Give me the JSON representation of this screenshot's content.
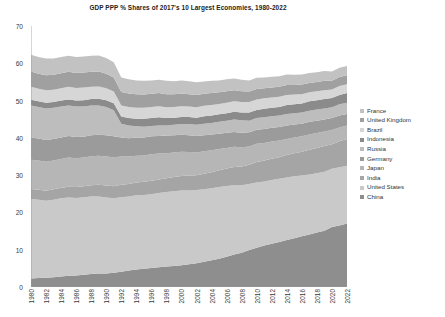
{
  "chart_data": {
    "type": "area",
    "stacked": true,
    "title": "GDP PPP % Shares of 2017's 10 Largest Economies, 1980-2022",
    "xlabel": "",
    "ylabel": "",
    "ylim": [
      0,
      70
    ],
    "ytick_step": 10,
    "yticks": [
      0,
      10,
      20,
      30,
      40,
      50,
      60,
      70
    ],
    "xlim": [
      1980,
      2022
    ],
    "xtick_step": 2,
    "grid": false,
    "legend_position": "right",
    "x": [
      1980,
      1981,
      1982,
      1983,
      1984,
      1985,
      1986,
      1987,
      1988,
      1989,
      1990,
      1991,
      1992,
      1993,
      1994,
      1995,
      1996,
      1997,
      1998,
      1999,
      2000,
      2001,
      2002,
      2003,
      2004,
      2005,
      2006,
      2007,
      2008,
      2009,
      2010,
      2011,
      2012,
      2013,
      2014,
      2015,
      2016,
      2017,
      2018,
      2019,
      2020,
      2021,
      2022
    ],
    "xticks": [
      1980,
      1982,
      1984,
      1986,
      1988,
      1990,
      1992,
      1994,
      1996,
      1998,
      2000,
      2002,
      2004,
      2006,
      2008,
      2010,
      2012,
      2014,
      2016,
      2018,
      2020,
      2022
    ],
    "stack_order_bottom_to_top": [
      "China",
      "United States",
      "India",
      "Japan",
      "Germany",
      "Russia",
      "Indonesia",
      "Brazil",
      "United Kingdom",
      "France"
    ],
    "series": [
      {
        "name": "China",
        "color": "#8e8e8e",
        "values": [
          2.3,
          2.4,
          2.5,
          2.6,
          2.8,
          3.0,
          3.1,
          3.3,
          3.5,
          3.6,
          3.6,
          3.8,
          4.1,
          4.4,
          4.7,
          4.9,
          5.1,
          5.3,
          5.5,
          5.6,
          5.8,
          6.1,
          6.4,
          6.8,
          7.2,
          7.6,
          8.1,
          8.7,
          9.2,
          9.9,
          10.5,
          11.1,
          11.6,
          12.1,
          12.6,
          13.1,
          13.6,
          14.1,
          14.6,
          15.1,
          16.1,
          16.5,
          17.0
        ]
      },
      {
        "name": "United States",
        "color": "#c9c9c9",
        "values": [
          21.3,
          21.0,
          20.6,
          20.8,
          21.0,
          21.0,
          20.8,
          20.8,
          20.8,
          20.7,
          20.4,
          20.0,
          20.0,
          19.9,
          19.9,
          19.8,
          19.8,
          19.9,
          20.0,
          20.1,
          20.1,
          19.8,
          19.6,
          19.4,
          19.3,
          19.2,
          19.0,
          18.6,
          18.1,
          17.7,
          17.5,
          17.2,
          17.1,
          16.9,
          16.8,
          16.6,
          16.3,
          16.1,
          15.9,
          15.8,
          15.6,
          15.6,
          15.5
        ]
      },
      {
        "name": "India",
        "color": "#a5a5a5",
        "values": [
          2.7,
          2.7,
          2.7,
          2.8,
          2.8,
          2.9,
          2.9,
          2.9,
          3.0,
          3.1,
          3.2,
          3.2,
          3.3,
          3.3,
          3.4,
          3.5,
          3.6,
          3.6,
          3.7,
          3.8,
          3.9,
          4.0,
          4.0,
          4.2,
          4.3,
          4.5,
          4.7,
          4.9,
          5.0,
          5.2,
          5.5,
          5.6,
          5.7,
          5.8,
          6.0,
          6.2,
          6.4,
          6.6,
          6.8,
          6.9,
          6.6,
          7.0,
          7.2
        ]
      },
      {
        "name": "Japan",
        "color": "#b6b6b6",
        "values": [
          7.8,
          7.8,
          7.8,
          7.7,
          7.7,
          7.8,
          7.7,
          7.7,
          7.8,
          7.8,
          7.8,
          7.8,
          7.6,
          7.4,
          7.2,
          7.1,
          7.1,
          7.0,
          6.7,
          6.6,
          6.5,
          6.3,
          6.1,
          6.0,
          5.9,
          5.7,
          5.5,
          5.4,
          5.2,
          4.9,
          4.9,
          4.7,
          4.6,
          4.5,
          4.3,
          4.2,
          4.1,
          4.1,
          4.0,
          3.9,
          3.8,
          3.7,
          3.6
        ]
      },
      {
        "name": "Germany",
        "color": "#9b9b9b",
        "values": [
          6.0,
          5.9,
          5.8,
          5.8,
          5.8,
          5.8,
          5.7,
          5.6,
          5.6,
          5.6,
          5.7,
          5.6,
          5.1,
          4.9,
          4.9,
          4.8,
          4.8,
          4.7,
          4.7,
          4.6,
          4.5,
          4.5,
          4.4,
          4.3,
          4.2,
          4.1,
          4.1,
          4.0,
          3.9,
          3.8,
          3.8,
          3.8,
          3.7,
          3.6,
          3.6,
          3.5,
          3.4,
          3.4,
          3.3,
          3.2,
          3.2,
          3.2,
          3.1
        ]
      },
      {
        "name": "Russia",
        "color": "#bdbdbd",
        "values": [
          8.6,
          8.5,
          8.5,
          8.4,
          8.3,
          8.2,
          8.2,
          8.1,
          8.0,
          7.9,
          7.6,
          7.0,
          3.7,
          3.4,
          3.0,
          2.9,
          2.8,
          2.8,
          2.7,
          2.8,
          2.9,
          3.0,
          3.0,
          3.1,
          3.1,
          3.2,
          3.2,
          3.3,
          3.3,
          3.1,
          3.1,
          3.1,
          3.1,
          3.1,
          3.1,
          3.0,
          3.0,
          3.0,
          3.0,
          3.0,
          2.9,
          3.0,
          3.0
        ]
      },
      {
        "name": "Indonesia",
        "color": "#8b8b8b",
        "values": [
          1.5,
          1.5,
          1.5,
          1.5,
          1.6,
          1.6,
          1.6,
          1.7,
          1.7,
          1.8,
          1.8,
          1.9,
          1.9,
          2.0,
          2.0,
          2.1,
          2.1,
          2.2,
          2.0,
          1.9,
          1.9,
          1.9,
          1.9,
          2.0,
          2.0,
          2.0,
          2.0,
          2.1,
          2.1,
          2.2,
          2.2,
          2.3,
          2.3,
          2.3,
          2.4,
          2.4,
          2.4,
          2.5,
          2.5,
          2.5,
          2.5,
          2.5,
          2.6
        ]
      },
      {
        "name": "Brazil",
        "color": "#d6d6d6",
        "values": [
          3.5,
          3.4,
          3.4,
          3.3,
          3.3,
          3.4,
          3.4,
          3.4,
          3.3,
          3.3,
          3.2,
          3.1,
          3.0,
          3.0,
          3.0,
          3.0,
          3.0,
          3.0,
          2.9,
          2.9,
          2.9,
          2.8,
          2.8,
          2.8,
          2.8,
          2.8,
          2.8,
          2.8,
          2.8,
          2.8,
          2.8,
          2.8,
          2.7,
          2.7,
          2.7,
          2.6,
          2.5,
          2.4,
          2.4,
          2.4,
          2.3,
          2.4,
          2.4
        ]
      },
      {
        "name": "United Kingdom",
        "color": "#a0a0a0",
        "values": [
          4.1,
          4.0,
          4.0,
          4.0,
          4.0,
          4.0,
          4.0,
          4.0,
          4.0,
          4.0,
          3.9,
          3.8,
          3.6,
          3.6,
          3.6,
          3.5,
          3.5,
          3.5,
          3.5,
          3.4,
          3.4,
          3.3,
          3.3,
          3.2,
          3.2,
          3.1,
          3.1,
          3.0,
          2.9,
          2.8,
          2.8,
          2.7,
          2.7,
          2.7,
          2.7,
          2.6,
          2.6,
          2.5,
          2.5,
          2.5,
          2.3,
          2.4,
          2.4
        ]
      },
      {
        "name": "France",
        "color": "#c2c2c2",
        "values": [
          4.5,
          4.5,
          4.5,
          4.4,
          4.4,
          4.3,
          4.3,
          4.3,
          4.3,
          4.3,
          4.2,
          4.1,
          3.9,
          3.8,
          3.7,
          3.7,
          3.6,
          3.6,
          3.6,
          3.5,
          3.5,
          3.5,
          3.4,
          3.3,
          3.3,
          3.2,
          3.2,
          3.1,
          3.1,
          3.0,
          3.0,
          2.9,
          2.9,
          2.8,
          2.8,
          2.7,
          2.7,
          2.7,
          2.6,
          2.6,
          2.5,
          2.5,
          2.5
        ]
      }
    ],
    "legend_entries": [
      {
        "label": "France",
        "color": "#c2c2c2"
      },
      {
        "label": "United Kingdom",
        "color": "#a0a0a0"
      },
      {
        "label": "Brazil",
        "color": "#d6d6d6"
      },
      {
        "label": "Indonesia",
        "color": "#8b8b8b"
      },
      {
        "label": "Russia",
        "color": "#bdbdbd"
      },
      {
        "label": "Germany",
        "color": "#9b9b9b"
      },
      {
        "label": "Japan",
        "color": "#b6b6b6"
      },
      {
        "label": "India",
        "color": "#a5a5a5"
      },
      {
        "label": "United States",
        "color": "#c9c9c9"
      },
      {
        "label": "China",
        "color": "#8e8e8e"
      }
    ]
  }
}
